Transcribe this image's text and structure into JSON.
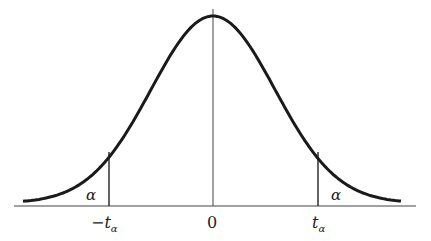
{
  "diagram": {
    "type": "normal-distribution-curve",
    "labels": {
      "alpha_left": "α",
      "alpha_right": "α",
      "neg_t": "−t",
      "neg_t_sub": "α",
      "zero": "0",
      "pos_t": "t",
      "pos_t_sub": "α"
    },
    "colors": {
      "curve": "#1a1a1a",
      "axis": "#333333",
      "background": "#ffffff"
    }
  }
}
